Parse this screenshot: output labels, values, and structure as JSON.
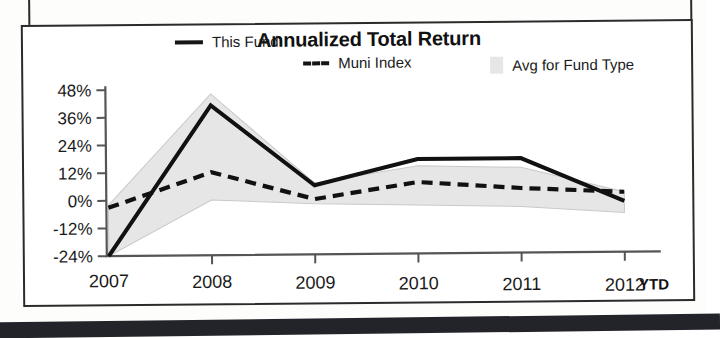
{
  "chart_panel": {
    "title": "Annualized Total Return",
    "legend": [
      {
        "label": "This Fund",
        "marker": "solid-line-swatch"
      },
      {
        "label": "Muni Index",
        "marker": "dashed-line-swatch"
      },
      {
        "label": "Avg for Fund Type",
        "marker": "gray-area-swatch"
      }
    ],
    "ytd_note": "YTD"
  },
  "chart_data": {
    "type": "line",
    "title": "Annualized Total Return",
    "xlabel": "",
    "ylabel": "",
    "categories": [
      "2007",
      "2008",
      "2009",
      "2010",
      "2011",
      "2012"
    ],
    "x_tick_labels": [
      "2007",
      "2008",
      "2009",
      "2010",
      "2011",
      "2012"
    ],
    "y_tick_labels": [
      "48%",
      "36%",
      "24%",
      "12%",
      "0%",
      "-12%",
      "-24%"
    ],
    "y_ticks": [
      48,
      36,
      24,
      12,
      0,
      -12,
      -24
    ],
    "ylim": [
      -24,
      48
    ],
    "y_unit": "%",
    "grid": false,
    "legend_position": "top",
    "series": [
      {
        "name": "This Fund",
        "style": "solid",
        "values": [
          -24,
          41,
          6,
          17,
          17,
          -2
        ]
      },
      {
        "name": "Muni Index",
        "style": "dashed",
        "values": [
          -3,
          12,
          0,
          7,
          4,
          2
        ]
      }
    ],
    "band": {
      "name": "Avg for Fund Type",
      "style": "shaded-range",
      "upper": [
        -2,
        46,
        7,
        14,
        13,
        2
      ],
      "lower": [
        -24,
        0,
        -2,
        -3,
        -4,
        -7
      ]
    },
    "annotations": [
      {
        "text": "YTD",
        "near": "2012",
        "position": "x-axis-right"
      }
    ]
  },
  "colors": {
    "line": "#111111",
    "band_fill": "#e6e6e6",
    "axis": "#555555",
    "panel_border": "#2b2b2b",
    "background": "#ffffff"
  }
}
